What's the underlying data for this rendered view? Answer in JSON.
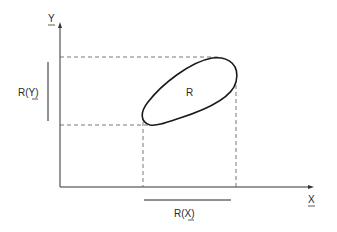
{
  "diagram": {
    "axes": {
      "x_label": "X",
      "y_label": "Y"
    },
    "region_label": "R",
    "range_x_label": "R(X)",
    "range_y_label": "R(Y)",
    "range_x_prefix": "R(",
    "range_x_var": "X",
    "range_x_suffix": ")",
    "range_y_prefix": "R(",
    "range_y_var": "Y",
    "range_y_suffix": ")",
    "colors": {
      "stroke": "#222222",
      "dashed": "#555555"
    }
  }
}
